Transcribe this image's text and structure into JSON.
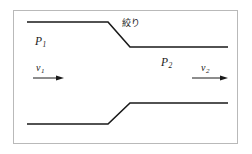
{
  "figure": {
    "kind": "pipe-flow-constriction-diagram",
    "frame": {
      "border_color": "#b9b9b9",
      "background_color": "#ffffff"
    },
    "stroke_color": "#1a1a1a",
    "labels": {
      "pressure_upstream": "P",
      "pressure_upstream_sub": "1",
      "pressure_downstream": "P",
      "pressure_downstream_sub": "2",
      "velocity_upstream": "v",
      "velocity_upstream_sub": "1",
      "velocity_downstream": "v",
      "velocity_downstream_sub": "2",
      "throttle": "絞り"
    },
    "geometry": {
      "upper_wall_points": "27,22 108,22 130,47 228,47",
      "lower_wall_points": "27,124 108,124 130,103 228,103",
      "upstream_pipe_top_y": 22,
      "upstream_pipe_bottom_y": 124,
      "downstream_pipe_top_y": 47,
      "downstream_pipe_bottom_y": 103,
      "constriction_start_x": 108,
      "constriction_end_x": 130
    },
    "arrows": {
      "upstream": {
        "x1": 33,
        "y1": 78,
        "x2": 64,
        "y2": 78,
        "direction": "right"
      },
      "downstream": {
        "x1": 192,
        "y1": 78,
        "x2": 228,
        "y2": 78,
        "direction": "right"
      }
    }
  }
}
